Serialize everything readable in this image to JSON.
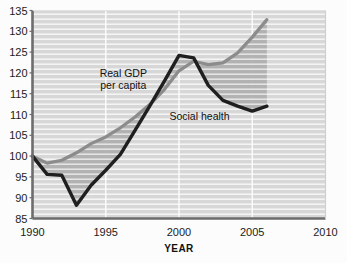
{
  "chart_data": {
    "type": "line",
    "title": "",
    "xlabel": "YEAR",
    "ylabel": "",
    "xlim": [
      1990,
      2010
    ],
    "ylim": [
      85,
      135
    ],
    "xticks": [
      "1990",
      "1995",
      "2000",
      "2005",
      "2010"
    ],
    "yticks": [
      "85",
      "90",
      "95",
      "100",
      "105",
      "110",
      "115",
      "120",
      "125",
      "130",
      "135"
    ],
    "grid": "horizontal-stripes-and-vertical-lines",
    "legend": "inline-annotations",
    "annotations": [
      {
        "text_line1": "Real GDP",
        "text_line2": "per capita",
        "x": 1996.2,
        "y": 119.0
      },
      {
        "text_line1": "Social health",
        "text_line2": "",
        "x": 2001.4,
        "y": 108.6
      }
    ],
    "shaded_gap": {
      "description": "hatched band between the two series",
      "color": "#b9b9b9"
    },
    "series": [
      {
        "name": "Real GDP per capita",
        "color": "#8c8c8c",
        "x": [
          1990,
          1991,
          1992,
          1993,
          1994,
          1995,
          1996,
          1997,
          1998,
          1999,
          2000,
          2001,
          2002,
          2003,
          2004,
          2005,
          2006
        ],
        "values": [
          100.0,
          98.3,
          99.0,
          100.8,
          103.0,
          104.6,
          106.8,
          109.4,
          112.4,
          116.0,
          120.5,
          122.8,
          122.0,
          122.4,
          124.8,
          128.6,
          132.8
        ]
      },
      {
        "name": "Social health",
        "color": "#1f1f1f",
        "x": [
          1990,
          1991,
          1992,
          1993,
          1994,
          1995,
          1996,
          1997,
          1998,
          1999,
          2000,
          2001,
          2002,
          2003,
          2004,
          2005,
          2006
        ],
        "values": [
          100.0,
          95.6,
          95.4,
          88.2,
          93.0,
          96.6,
          100.4,
          106.2,
          112.0,
          118.0,
          124.2,
          123.6,
          117.0,
          113.4,
          112.0,
          110.8,
          112.0
        ]
      }
    ]
  }
}
